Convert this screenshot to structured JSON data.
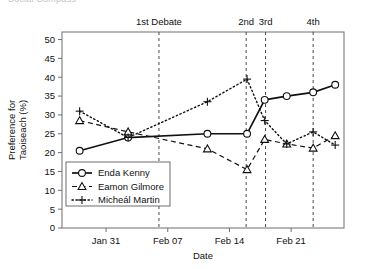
{
  "figure": {
    "clipped_top_text": "Social Compass",
    "axis_color": "#6f6f6f"
  },
  "chart_data": {
    "type": "line",
    "title": "",
    "xlabel": "Date",
    "ylabel": "Preference for\nTaoiseach (%)",
    "ylabel_line1": "Preference for",
    "ylabel_line2": "Taoiseach (%)",
    "ylim": [
      0,
      52
    ],
    "yticks": [
      0,
      5,
      10,
      15,
      20,
      25,
      30,
      35,
      40,
      45,
      50
    ],
    "xlim": [
      0,
      32
    ],
    "xticks": [
      5,
      12,
      19,
      26
    ],
    "xticklabels": [
      "Jan 31",
      "Feb 07",
      "Feb 14",
      "Feb 21"
    ],
    "grid": false,
    "legend_position": "lower left",
    "x": [
      2.0,
      7.5,
      16.5,
      21.0,
      23.0,
      25.5,
      28.5,
      31.0
    ],
    "series": [
      {
        "name": "Enda Kenny",
        "marker": "circle",
        "linestyle": "solid",
        "color": "#111111",
        "x": [
          2.0,
          7.5,
          16.5,
          21.0,
          23.0,
          25.5,
          28.5,
          31.0
        ],
        "values": [
          20.5,
          24.0,
          25.0,
          25.0,
          34.0,
          35.0,
          36.0,
          38.0
        ]
      },
      {
        "name": "Eamon Gilmore",
        "marker": "triangle",
        "linestyle": "dashed",
        "color": "#111111",
        "x": [
          2.0,
          7.5,
          16.5,
          21.0,
          23.0,
          25.5,
          28.5,
          31.0
        ],
        "values": [
          28.5,
          25.5,
          21.0,
          15.5,
          23.5,
          22.3,
          21.2,
          24.5
        ]
      },
      {
        "name": "Micheál Martin",
        "marker": "plus",
        "linestyle": "dotted",
        "color": "#111111",
        "x": [
          2.0,
          7.5,
          16.5,
          21.0,
          23.0,
          25.5,
          28.5,
          31.0
        ],
        "values": [
          31.0,
          24.0,
          33.5,
          39.5,
          28.5,
          22.3,
          25.5,
          22.0
        ]
      }
    ],
    "annotations": [
      {
        "label": "1st Debate",
        "x": 11.0,
        "type": "vline",
        "linestyle": "dashed"
      },
      {
        "label": "2nd",
        "x": 20.9,
        "type": "vline",
        "linestyle": "dashed"
      },
      {
        "label": "3rd",
        "x": 23.1,
        "type": "vline",
        "linestyle": "dashed"
      },
      {
        "label": "4th",
        "x": 28.5,
        "type": "vline",
        "linestyle": "dashed"
      }
    ]
  },
  "legend": {
    "entries": [
      {
        "label": "Enda Kenny"
      },
      {
        "label": "Eamon Gilmore"
      },
      {
        "label": "Micheál Martin"
      }
    ]
  }
}
